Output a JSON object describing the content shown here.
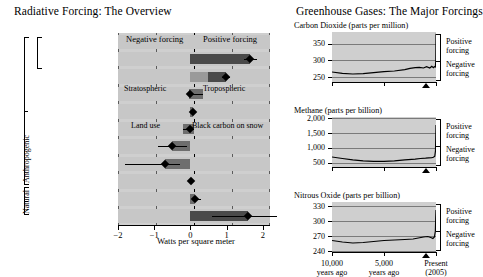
{
  "left": {
    "title": "Radiative Forcing: The Overview",
    "axis_label": "Watts per square meter",
    "header_negative": "Negative forcing",
    "header_positive": "Positive forcing",
    "ticks": [
      "-2",
      "-1",
      "0",
      "1",
      "2"
    ],
    "group_labels": {
      "anthropogenic": "Anthropogenic",
      "natural": "Natural"
    },
    "inline_labels": {
      "stratospheric": "Stratospheric",
      "tropospheric": "Tropospheric",
      "land_use": "Land use",
      "black_carbon": "Black carbon on snow"
    },
    "categories": [
      "Greenhouse gases",
      "Carbon dioxide",
      "Methane,\nnitrous oxide\nand halocarbons",
      "Ozone",
      "Stratospheric water\nvapor from methane",
      "Surface albedo",
      "Aerosols: reflection\nof sunlight",
      "Aerosols: effect\non clouds",
      "Contrails",
      "Solar energy",
      "Net anthropogenic\nforcing"
    ]
  },
  "right": {
    "title": "Greenhouse Gases: The Major Forcings",
    "positive_label": "Positive\nforcing",
    "negative_label": "Negative\nforcing",
    "xticks": [
      "10,000\nyears ago",
      "5,000\nyears ago",
      "Present\n(2005)"
    ],
    "panels": [
      {
        "title": "Carbon Dioxide (parts per million)",
        "yticks": [
          "350",
          "300",
          "250"
        ]
      },
      {
        "title": "Methane (parts per billion)",
        "yticks": [
          "2,000",
          "1,500",
          "1,000",
          "500"
        ]
      },
      {
        "title": "Nitrous Oxide (parts per billion)",
        "yticks": [
          "330",
          "300",
          "270",
          "240"
        ]
      }
    ]
  },
  "colors": {
    "plot_bg": "#cfcfcf",
    "band_bg": "#c7c7c7",
    "bar_dark": "#4a4a4a",
    "bar_mid": "#6e6e6e",
    "bar_light": "#9a9a9a",
    "grid": "#5b5b5b",
    "axis": "#000000"
  },
  "chart_data": {
    "type": "bar",
    "title": "Radiative Forcing: The Overview",
    "xlabel": "Watts per square meter",
    "ylabel": "",
    "xlim": [
      -2,
      2.2
    ],
    "grid": true,
    "legend": "none",
    "orientation": "horizontal",
    "categories": [
      "Greenhouse gases",
      "Carbon dioxide",
      "Methane, nitrous oxide and halocarbons",
      "Ozone",
      "Stratospheric water vapor from methane",
      "Surface albedo",
      "Aerosols: reflection of sunlight",
      "Aerosols: effect on clouds",
      "Contrails",
      "Solar energy",
      "Net anthropogenic forcing"
    ],
    "bars": [
      {
        "category": "Greenhouse gases",
        "value": null,
        "low": null,
        "high": null,
        "note": "group heading row, no bar"
      },
      {
        "category": "Carbon dioxide",
        "value": 1.66,
        "low": 1.49,
        "high": 1.83,
        "segments": [
          {
            "from": 0.0,
            "to": 1.66,
            "shade": "dark"
          }
        ]
      },
      {
        "category": "Methane, nitrous oxide and halocarbons",
        "value": 0.98,
        "low": 0.86,
        "high": 1.1,
        "segments": [
          {
            "from": 0.0,
            "to": 0.48,
            "shade": "light"
          },
          {
            "from": 0.48,
            "to": 0.98,
            "shade": "dark"
          }
        ]
      },
      {
        "category": "Ozone",
        "value": 0.0,
        "low": -0.05,
        "high": 0.35,
        "segments": [
          {
            "from": -0.05,
            "to": 0.0,
            "shade": "mid",
            "label": "Stratospheric"
          },
          {
            "from": 0.0,
            "to": 0.35,
            "shade": "mid",
            "label": "Tropospheric"
          }
        ]
      },
      {
        "category": "Stratospheric water vapor from methane",
        "value": 0.07,
        "low": 0.02,
        "high": 0.12,
        "segments": [
          {
            "from": 0.0,
            "to": 0.07,
            "shade": "mid"
          }
        ]
      },
      {
        "category": "Surface albedo",
        "value": 0.0,
        "low": -0.2,
        "high": 0.1,
        "segments": [
          {
            "from": -0.2,
            "to": 0.0,
            "shade": "mid",
            "label": "Land use"
          },
          {
            "from": 0.0,
            "to": 0.1,
            "shade": "mid",
            "label": "Black carbon on snow"
          }
        ]
      },
      {
        "category": "Aerosols: reflection of sunlight",
        "value": -0.5,
        "low": -0.9,
        "high": -0.1,
        "segments": [
          {
            "from": -0.5,
            "to": 0.0,
            "shade": "mid"
          }
        ]
      },
      {
        "category": "Aerosols: effect on clouds",
        "value": -0.7,
        "low": -1.8,
        "high": -0.3,
        "segments": [
          {
            "from": -0.7,
            "to": 0.0,
            "shade": "mid"
          }
        ]
      },
      {
        "category": "Contrails",
        "value": 0.01,
        "low": 0.003,
        "high": 0.03,
        "segments": []
      },
      {
        "category": "Solar energy",
        "value": 0.12,
        "low": 0.06,
        "high": 0.3,
        "segments": [
          {
            "from": 0.0,
            "to": 0.12,
            "shade": "mid"
          }
        ]
      },
      {
        "category": "Net anthropogenic forcing",
        "value": 1.6,
        "low": 0.6,
        "high": 2.4,
        "segments": [
          {
            "from": 0.0,
            "to": 1.6,
            "shade": "dark"
          }
        ]
      }
    ],
    "subcharts": [
      {
        "type": "line",
        "title": "Carbon Dioxide (parts per million)",
        "ylabel": "parts per million",
        "ylim": [
          235,
          385
        ],
        "yticks": [
          350,
          300,
          250
        ],
        "xlim": [
          -10000,
          0
        ],
        "xticks": [
          -10000,
          -5000,
          0
        ],
        "xticklabels": [
          "10,000 years ago",
          "5,000 years ago",
          "Present (2005)"
        ],
        "x": [
          -10000,
          -9000,
          -8000,
          -7000,
          -6000,
          -5000,
          -4000,
          -3000,
          -2500,
          -2000,
          -1600,
          -1200,
          -900,
          -600,
          -400,
          -250,
          -150,
          -60,
          -20,
          0
        ],
        "y": [
          265,
          261,
          259,
          260,
          263,
          266,
          268,
          272,
          276,
          278,
          279,
          277,
          281,
          277,
          282,
          278,
          281,
          280,
          300,
          380
        ]
      },
      {
        "type": "line",
        "title": "Methane (parts per billion)",
        "ylabel": "parts per billion",
        "ylim": [
          350,
          2050
        ],
        "yticks": [
          2000,
          1500,
          1000,
          500
        ],
        "xlim": [
          -10000,
          0
        ],
        "xticks": [
          -10000,
          -5000,
          0
        ],
        "xticklabels": [
          "10,000 years ago",
          "5,000 years ago",
          "Present (2005)"
        ],
        "x": [
          -10000,
          -9000,
          -8000,
          -7000,
          -6000,
          -5000,
          -4000,
          -3000,
          -2000,
          -1500,
          -1000,
          -700,
          -400,
          -250,
          -120,
          -50,
          -20,
          0
        ],
        "y": [
          690,
          640,
          590,
          560,
          545,
          540,
          560,
          590,
          620,
          640,
          650,
          660,
          670,
          680,
          720,
          900,
          1400,
          1780
        ]
      },
      {
        "type": "line",
        "title": "Nitrous Oxide (parts per billion)",
        "ylabel": "parts per billion",
        "ylim": [
          238,
          338
        ],
        "yticks": [
          330,
          300,
          270,
          240
        ],
        "xlim": [
          -10000,
          0
        ],
        "xticks": [
          -10000,
          -5000,
          0
        ],
        "xticklabels": [
          "10,000 years ago",
          "5,000 years ago",
          "Present (2005)"
        ],
        "x": [
          -10000,
          -9000,
          -8000,
          -7000,
          -6000,
          -5000,
          -4000,
          -3000,
          -2200,
          -1700,
          -1200,
          -800,
          -500,
          -300,
          -150,
          -60,
          -25,
          0
        ],
        "y": [
          261,
          258,
          256,
          257,
          259,
          261,
          262,
          263,
          264,
          266,
          268,
          269,
          267,
          265,
          268,
          280,
          305,
          322
        ]
      }
    ]
  }
}
